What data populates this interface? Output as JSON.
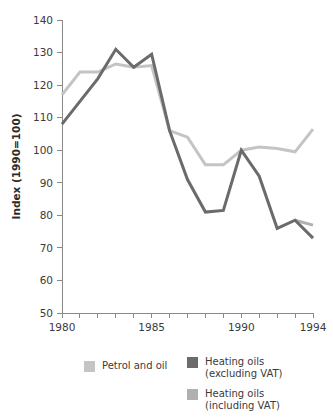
{
  "chart_data": {
    "type": "line",
    "title": "",
    "xlabel": "",
    "ylabel": "Index (1990=100)",
    "x": [
      1980,
      1981,
      1982,
      1983,
      1984,
      1985,
      1986,
      1987,
      1988,
      1989,
      1990,
      1991,
      1992,
      1993,
      1994
    ],
    "xlim": [
      1980,
      1994
    ],
    "ylim": [
      50,
      140
    ],
    "y_ticks": [
      50,
      60,
      70,
      80,
      90,
      100,
      110,
      120,
      130,
      140
    ],
    "x_ticks": [
      1980,
      1981,
      1982,
      1983,
      1984,
      1985,
      1986,
      1987,
      1988,
      1989,
      1990,
      1991,
      1992,
      1993,
      1994
    ],
    "x_tick_labels": [
      "1980",
      "",
      "",
      "",
      "",
      "1985",
      "",
      "",
      "",
      "",
      "1990",
      "",
      "",
      "",
      "1994"
    ],
    "grid": false,
    "legend_position": "bottom",
    "series": [
      {
        "name": "Petrol and oil",
        "color": "#c4c4c4",
        "x": [
          1980,
          1981,
          1982,
          1983,
          1984,
          1985,
          1986,
          1987,
          1988,
          1989,
          1990,
          1991,
          1992,
          1993,
          1994
        ],
        "values": [
          117,
          124,
          124,
          126.5,
          125.5,
          126,
          106,
          104,
          95.5,
          95.5,
          100,
          101,
          100.5,
          99.5,
          106.5
        ]
      },
      {
        "name": "Heating oils (excluding VAT)",
        "color": "#6b6b6b",
        "x": [
          1980,
          1981,
          1982,
          1983,
          1984,
          1985,
          1986,
          1987,
          1988,
          1989,
          1990,
          1991,
          1992,
          1993,
          1994
        ],
        "values": [
          108,
          115,
          122,
          131,
          125.5,
          129.5,
          106,
          91,
          81,
          81.5,
          100,
          92,
          76,
          78.5,
          73
        ]
      },
      {
        "name": "Heating oils (including VAT)",
        "color": "#b0b0b0",
        "x": [
          1993,
          1994
        ],
        "values": [
          78.5,
          77
        ]
      }
    ]
  },
  "legend": {
    "entries": [
      {
        "label": "Petrol and oil",
        "color": "#c4c4c4"
      },
      {
        "label": "Heating oils\n(excluding VAT)",
        "color": "#6b6b6b"
      },
      {
        "label": "Heating oils\n(including VAT)",
        "color": "#b0b0b0"
      }
    ]
  },
  "axes": {
    "y_title": "Index (1990=100)",
    "y_tick_labels": [
      "140",
      "130",
      "120",
      "110",
      "100",
      "90",
      "80",
      "70",
      "60",
      "50"
    ],
    "x_tick_labels_visible": [
      "1980",
      "1985",
      "1990",
      "1994"
    ]
  }
}
